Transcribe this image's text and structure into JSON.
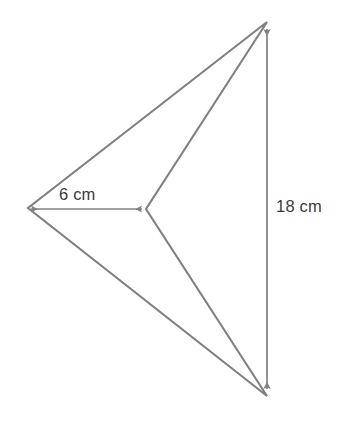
{
  "figure": {
    "kind": "geometry-diagram",
    "background_color": "#ffffff",
    "stroke_color": "#808080",
    "stroke_width": 2.1,
    "text_color": "#3a3a3a",
    "canvas": {
      "width": 343,
      "height": 423
    },
    "vertices": {
      "top": {
        "x": 267,
        "y": 22
      },
      "bottom": {
        "x": 267,
        "y": 396
      },
      "left": {
        "x": 28,
        "y": 208
      },
      "center": {
        "x": 146,
        "y": 209
      }
    },
    "edges": [
      {
        "name": "top-to-left",
        "from": "top",
        "to": "left"
      },
      {
        "name": "top-to-center",
        "from": "top",
        "to": "center"
      },
      {
        "name": "bottom-to-left",
        "from": "bottom",
        "to": "left"
      },
      {
        "name": "bottom-to-center",
        "from": "bottom",
        "to": "center"
      }
    ],
    "dimensions": [
      {
        "id": "base",
        "label": "6 cm",
        "value": 6,
        "unit": "cm",
        "orientation": "horizontal",
        "arrow_heads": "both",
        "from": {
          "x": 28,
          "y": 209
        },
        "to": {
          "x": 145,
          "y": 209
        }
      },
      {
        "id": "height",
        "label": "18 cm",
        "value": 18,
        "unit": "cm",
        "orientation": "vertical",
        "arrow_heads": "both",
        "from": {
          "x": 267,
          "y": 25
        },
        "to": {
          "x": 267,
          "y": 393
        }
      }
    ]
  }
}
